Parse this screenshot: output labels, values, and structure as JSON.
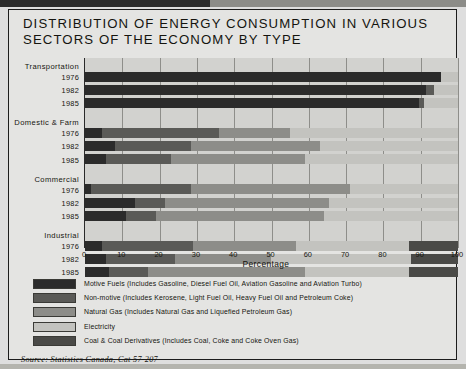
{
  "chart_data": {
    "type": "bar",
    "orientation": "horizontal",
    "stacked": true,
    "stack_mode": "percent",
    "title": "DISTRIBUTION OF ENERGY CONSUMPTION IN VARIOUS\nSECTORS OF THE ECONOMY BY TYPE",
    "xlabel": "Percentage",
    "ylabel": "",
    "xlim": [
      0,
      100
    ],
    "xticks": [
      0,
      10,
      20,
      30,
      40,
      50,
      60,
      70,
      80,
      90,
      100
    ],
    "grid": true,
    "legend_position": "below-plot",
    "series": [
      {
        "name": "Motive Fuels (Includes Gasoline, Diesel Fuel Oil, Aviation Gasoline and Aviation Turbo)",
        "short": "Motive Fuels",
        "color": "#2b2b2b"
      },
      {
        "name": "Non-motive (Includes Kerosene, Light Fuel Oil, Heavy Fuel Oil and Petroleum Coke)",
        "short": "Non-motive",
        "color": "#5a5a57"
      },
      {
        "name": "Natural Gas (Includes Natural Gas and Liquefied Petroleum Gas)",
        "short": "Natural Gas",
        "color": "#8d8d89"
      },
      {
        "name": "Electricity",
        "short": "Electricity",
        "color": "#c3c3bf"
      },
      {
        "name": "Coal & Coal Derivatives (Includes Coal, Coke and Coke Oven Gas)",
        "short": "Coal & Coal Derivatives",
        "color": "#4a4a47"
      }
    ],
    "groups": [
      {
        "label": "Transportation",
        "rows": [
          {
            "year": "1976",
            "values": [
              95.5,
              0.0,
              0.0,
              4.5,
              0.0
            ]
          },
          {
            "year": "1982",
            "values": [
              91.5,
              2.0,
              0.0,
              6.5,
              0.0
            ]
          },
          {
            "year": "1985",
            "values": [
              89.5,
              1.5,
              0.0,
              9.0,
              0.0
            ]
          }
        ]
      },
      {
        "label": "Domestic & Farm",
        "rows": [
          {
            "year": "1976",
            "values": [
              4.5,
              31.5,
              19.0,
              45.0,
              0.0
            ]
          },
          {
            "year": "1982",
            "values": [
              8.0,
              20.5,
              34.5,
              37.0,
              0.0
            ]
          },
          {
            "year": "1985",
            "values": [
              5.5,
              17.5,
              36.0,
              41.0,
              0.0
            ]
          }
        ]
      },
      {
        "label": "Commercial",
        "rows": [
          {
            "year": "1976",
            "values": [
              1.5,
              27.0,
              42.5,
              29.0,
              0.0
            ]
          },
          {
            "year": "1982",
            "values": [
              13.5,
              8.0,
              44.0,
              34.5,
              0.0
            ]
          },
          {
            "year": "1985",
            "values": [
              11.0,
              8.0,
              45.0,
              36.0,
              0.0
            ]
          }
        ]
      },
      {
        "label": "Industrial",
        "rows": [
          {
            "year": "1976",
            "values": [
              4.5,
              24.5,
              27.5,
              30.5,
              13.0
            ]
          },
          {
            "year": "1982",
            "values": [
              5.5,
              18.5,
              26.0,
              37.5,
              12.5
            ]
          },
          {
            "year": "1985",
            "values": [
              6.5,
              10.5,
              42.0,
              28.0,
              13.0
            ]
          }
        ]
      }
    ]
  },
  "footer": {
    "source": "Source: Statistics Canada, Cat 57-207"
  }
}
